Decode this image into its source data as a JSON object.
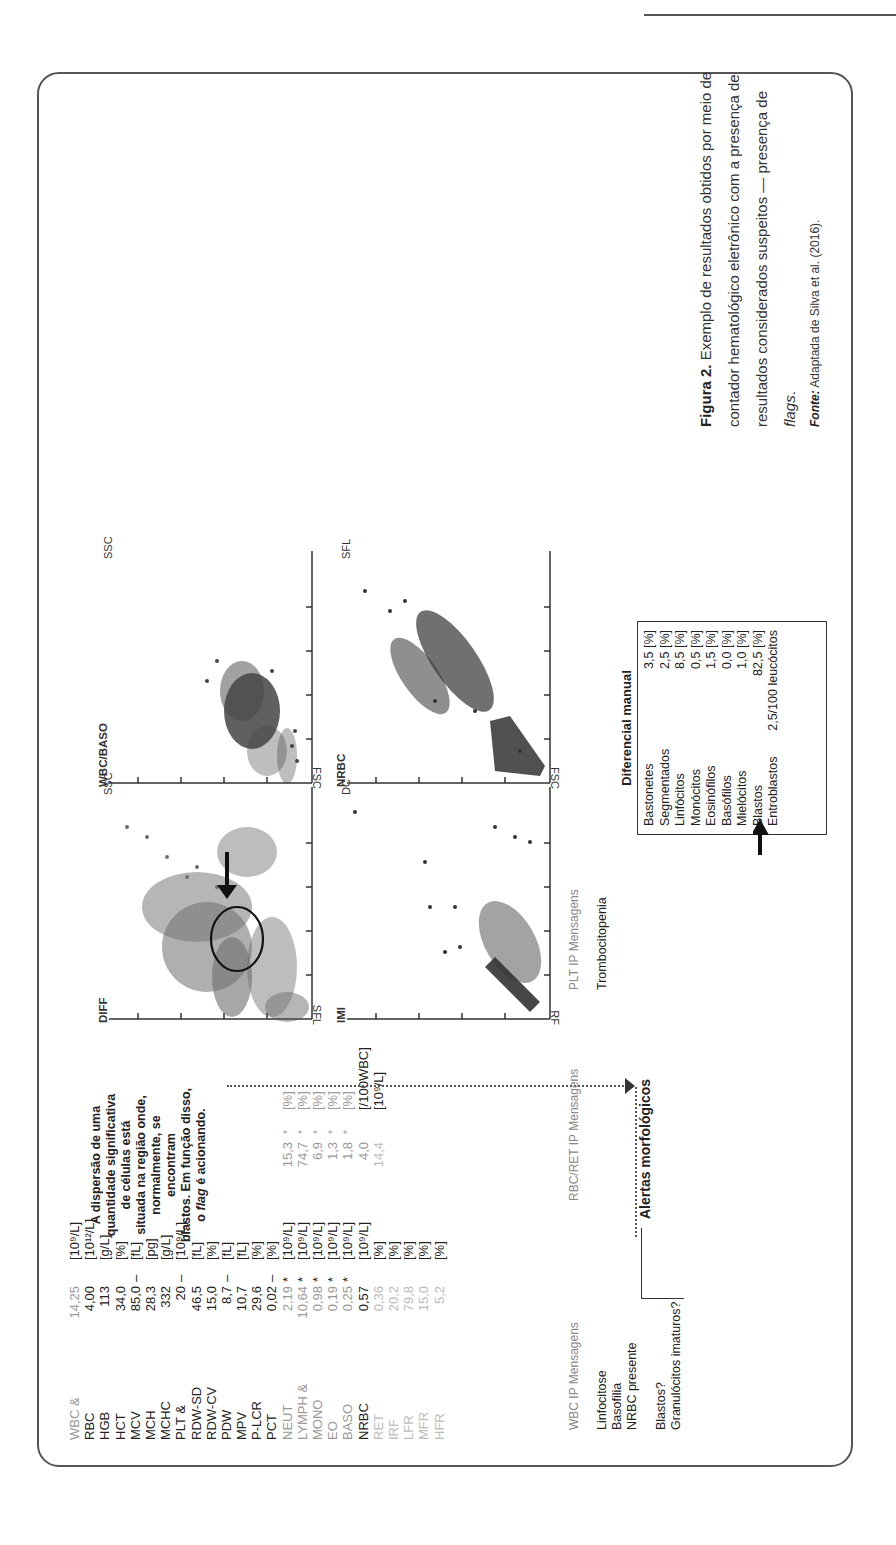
{
  "page": {
    "header_rule": true,
    "page_mark": "g"
  },
  "params": [
    {
      "name": "WBC &",
      "value": "14,25",
      "flag": "",
      "unit": "[10⁹/L]",
      "style": "light"
    },
    {
      "name": "RBC",
      "value": "4,00",
      "flag": "",
      "unit": "[10¹²/L]",
      "style": "dark"
    },
    {
      "name": "HGB",
      "value": "113",
      "flag": "",
      "unit": "[g/L]",
      "style": "dark"
    },
    {
      "name": "HCT",
      "value": "34,0",
      "flag": "",
      "unit": "[%]",
      "style": "dark"
    },
    {
      "name": "MCV",
      "value": "85,0",
      "flag": "–",
      "unit": "[fL]",
      "style": "dark"
    },
    {
      "name": "MCH",
      "value": "28,3",
      "flag": "",
      "unit": "[pg]",
      "style": "dark"
    },
    {
      "name": "MCHC",
      "value": "332",
      "flag": "",
      "unit": "[g/L]",
      "style": "dark"
    },
    {
      "name": "PLT &",
      "value": "20",
      "flag": "–",
      "unit": "[10⁹/L]",
      "style": "dark"
    },
    {
      "name": "RDW-SD",
      "value": "46,5",
      "flag": "",
      "unit": "[fL]",
      "style": "dark"
    },
    {
      "name": "RDW-CV",
      "value": "15,0",
      "flag": "",
      "unit": "[%]",
      "style": "dark"
    },
    {
      "name": "PDW",
      "value": "8,7",
      "flag": "–",
      "unit": "[fL]",
      "style": "dark"
    },
    {
      "name": "MPV",
      "value": "10,7",
      "flag": "",
      "unit": "[fL]",
      "style": "dark"
    },
    {
      "name": "P-LCR",
      "value": "29,6",
      "flag": "",
      "unit": "[%]",
      "style": "dark"
    },
    {
      "name": "PCT",
      "value": "0,02",
      "flag": "–",
      "unit": "[%]",
      "style": "dark"
    },
    {
      "name": "NEUT",
      "value": "2,19",
      "flag": "*",
      "unit": "[10⁹/L]",
      "style": "light",
      "value2": "15,3",
      "flag2": "*",
      "unit2": "[%]"
    },
    {
      "name": "LYMPH &",
      "value": "10,64",
      "flag": "*",
      "unit": "[10⁹/L]",
      "style": "light",
      "value2": "74,7",
      "flag2": "*",
      "unit2": "[%]"
    },
    {
      "name": "MONO",
      "value": "0,98",
      "flag": "*",
      "unit": "[10⁹/L]",
      "style": "light",
      "value2": "6,9",
      "flag2": "*",
      "unit2": "[%]"
    },
    {
      "name": "EO",
      "value": "0,19",
      "flag": "*",
      "unit": "[10⁹/L]",
      "style": "light",
      "value2": "1,3",
      "flag2": "*",
      "unit2": "[%]"
    },
    {
      "name": "BASO",
      "value": "0,25",
      "flag": "*",
      "unit": "[10⁹/L]",
      "style": "light",
      "value2": "1,8",
      "flag2": "*",
      "unit2": "[%]"
    },
    {
      "name": "NRBC",
      "value": "0,57",
      "flag": "",
      "unit": "[10⁹/L]",
      "style": "dark",
      "value2": "4,0",
      "flag2": "",
      "unit2": "[/100WBC]"
    },
    {
      "name": "RET",
      "value": "0,36",
      "flag": "",
      "unit": "[%]",
      "style": "lighter",
      "value2": "14,4",
      "flag2": "",
      "unit2": "[10⁹/L]"
    },
    {
      "name": "IRF",
      "value": "20,2",
      "flag": "",
      "unit": "[%]",
      "style": "lighter"
    },
    {
      "name": "LFR",
      "value": "79,8",
      "flag": "",
      "unit": "[%]",
      "style": "lighter"
    },
    {
      "name": "MFR",
      "value": "15,0",
      "flag": "",
      "unit": "[%]",
      "style": "lighter"
    },
    {
      "name": "HFR",
      "value": "5,2",
      "flag": "",
      "unit": "[%]",
      "style": "lighter"
    }
  ],
  "annotation": {
    "lines": [
      "A dispersão de uma",
      "quantidade significativa",
      "de células está",
      "situada na região onde,",
      "normalmente, se encontram",
      "blastos. Em função disso,"
    ],
    "last_line_pre": "o ",
    "last_line_italic": "flag",
    "last_line_post": " é acionando."
  },
  "plots": {
    "diff": {
      "title": "DIFF",
      "xlabel": "SSC",
      "ylabel": "SFL"
    },
    "wbc_baso": {
      "title": "WBC/BASO",
      "xlabel": "SSC",
      "ylabel": "FSC"
    },
    "imi": {
      "title": "IMI",
      "xlabel": "DC",
      "ylabel": "RF"
    },
    "nrbc": {
      "title": "NRBC",
      "xlabel": "SFL",
      "ylabel": "FSC"
    }
  },
  "messages": {
    "wbc": {
      "header": "WBC IP Mensagens",
      "items": [
        "Linfocitose",
        "Basofilia",
        "NRBC presente"
      ],
      "items2": [
        "Blastos?",
        "Granulócitos imaturos?"
      ]
    },
    "rbc": {
      "header": "RBC/RET IP Mensagens"
    },
    "plt": {
      "header": "PLT IP Mensagens",
      "items": [
        "Trombocitopenia"
      ]
    },
    "alert_title": "Alertas morfológicos"
  },
  "differential": {
    "title": "Diferencial manual",
    "rows": [
      {
        "label": "Bastonetes",
        "value": "3,5 [%]"
      },
      {
        "label": "Segmentados",
        "value": "2,5 [%]"
      },
      {
        "label": "Linfócitos",
        "value": "8,5 [%]"
      },
      {
        "label": "Monócitos",
        "value": "0,5 [%]"
      },
      {
        "label": "Eosinófilos",
        "value": "1,5 [%]"
      },
      {
        "label": "Basófilos",
        "value": "0,0 [%]"
      },
      {
        "label": "Mielócitos",
        "value": "1,0 [%]"
      },
      {
        "label": "Blastos",
        "value": "82,5 [%]"
      },
      {
        "label": "Entroblastos",
        "value": "2,5/100 leucócitos"
      }
    ]
  },
  "caption": {
    "label": "Figura 2.",
    "text": " Exemplo de resultados obtidos por meio de contador hematológico eletrônico com a presença de resultados considerados suspeitos — presença de ",
    "italic": "flags",
    "end": ".",
    "source_label": "Fonte:",
    "source_text": " Adaptada de Silva et al. (2016)."
  }
}
